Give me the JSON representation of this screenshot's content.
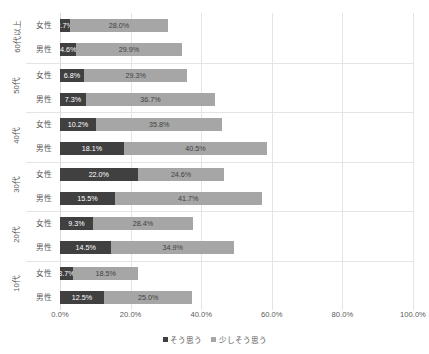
{
  "chart_data": {
    "type": "bar",
    "orientation": "horizontal",
    "stacked": true,
    "title": "",
    "xlabel": "",
    "ylabel": "",
    "xlim": [
      0,
      100
    ],
    "grid": true,
    "legend_position": "bottom",
    "xticks": [
      "0.0%",
      "20.0%",
      "40.0%",
      "60.0%",
      "80.0%",
      "100.0%"
    ],
    "xtick_values": [
      0,
      20,
      40,
      60,
      80,
      100
    ],
    "legend": [
      {
        "name": "そう思う",
        "color": "#404040"
      },
      {
        "name": "少しそう思う",
        "color": "#a6a6a6"
      }
    ],
    "groups": [
      {
        "age": "60代以上",
        "rows": [
          {
            "gender": "女性",
            "values": [
              2.7,
              28.0
            ],
            "labels": [
              "2.7%",
              "28.0%"
            ]
          },
          {
            "gender": "男性",
            "values": [
              4.6,
              29.9
            ],
            "labels": [
              "4.6%",
              "29.9%"
            ]
          }
        ]
      },
      {
        "age": "50代",
        "rows": [
          {
            "gender": "女性",
            "values": [
              6.8,
              29.3
            ],
            "labels": [
              "6.8%",
              "29.3%"
            ]
          },
          {
            "gender": "男性",
            "values": [
              7.3,
              36.7
            ],
            "labels": [
              "7.3%",
              "36.7%"
            ]
          }
        ]
      },
      {
        "age": "40代",
        "rows": [
          {
            "gender": "女性",
            "values": [
              10.2,
              35.8
            ],
            "labels": [
              "10.2%",
              "35.8%"
            ]
          },
          {
            "gender": "男性",
            "values": [
              18.1,
              40.5
            ],
            "labels": [
              "18.1%",
              "40.5%"
            ]
          }
        ]
      },
      {
        "age": "30代",
        "rows": [
          {
            "gender": "女性",
            "values": [
              22.0,
              24.6
            ],
            "labels": [
              "22.0%",
              "24.6%"
            ]
          },
          {
            "gender": "男性",
            "values": [
              15.5,
              41.7
            ],
            "labels": [
              "15.5%",
              "41.7%"
            ]
          }
        ]
      },
      {
        "age": "20代",
        "rows": [
          {
            "gender": "女性",
            "values": [
              9.3,
              28.4
            ],
            "labels": [
              "9.3%",
              "28.4%"
            ]
          },
          {
            "gender": "男性",
            "values": [
              14.5,
              34.9
            ],
            "labels": [
              "14.5%",
              "34.9%"
            ]
          }
        ]
      },
      {
        "age": "10代",
        "rows": [
          {
            "gender": "女性",
            "values": [
              3.7,
              18.5
            ],
            "labels": [
              "3.7%",
              "18.5%"
            ]
          },
          {
            "gender": "男性",
            "values": [
              12.5,
              25.0
            ],
            "labels": [
              "12.5%",
              "25.0%"
            ]
          }
        ]
      }
    ]
  },
  "colors": {
    "series1": "#404040",
    "series2": "#a6a6a6",
    "gridline": "#e4e4e4",
    "text": "#595959",
    "background": "#ffffff"
  }
}
